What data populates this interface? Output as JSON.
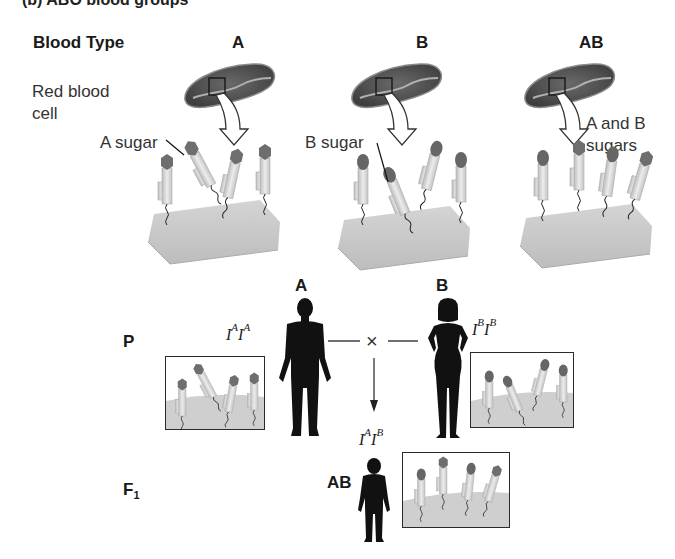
{
  "figure": {
    "caption_cut": "(b) ABO blood groups",
    "header_row": {
      "row_label": "Blood Type",
      "columns": [
        "A",
        "B",
        "AB"
      ]
    },
    "row_label_cell": "Red blood\ncell",
    "cell_line1": "Red blood",
    "cell_line2": "cell",
    "sugar_labels": {
      "a": "A sugar",
      "b": "B sugar",
      "ab_line1": "A and B",
      "ab_line2": "sugars"
    },
    "cross": {
      "p_label": "P",
      "f1_label": "F",
      "f1_sub": "1",
      "cross_symbol": "×",
      "parent_a": {
        "phenotype": "A",
        "genotype": {
          "allele1": "I",
          "sup1": "A",
          "allele2": "I",
          "sup2": "A"
        }
      },
      "parent_b": {
        "phenotype": "B",
        "genotype": {
          "allele1": "I",
          "sup1": "B",
          "allele2": "I",
          "sup2": "B"
        }
      },
      "offspring": {
        "phenotype": "AB",
        "genotype": {
          "allele1": "I",
          "sup1": "A",
          "allele2": "I",
          "sup2": "B"
        }
      }
    },
    "colors": {
      "rbc_fill": "#5a5a5a",
      "rbc_highlight": "#9c9c9c",
      "membrane": "#c8c8c8",
      "glyco_stem": "#d8d8d8",
      "sugar_cap": "#6e6e6e",
      "silhouette": "#111111"
    }
  }
}
